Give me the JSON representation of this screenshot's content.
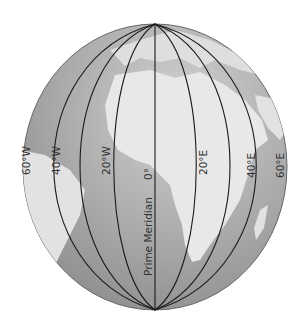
{
  "figure": {
    "type": "globe-meridians",
    "colors": {
      "ocean": "#9a9a9a",
      "ocean_light": "#c4c4c4",
      "land": "#e6e6e6",
      "lines": "#1a1a1a",
      "text": "#333333"
    },
    "meridians": [
      {
        "label": "60°W",
        "lon": -60
      },
      {
        "label": "40°W",
        "lon": -40
      },
      {
        "label": "20°W",
        "lon": -20
      },
      {
        "label": "0°",
        "lon": 0
      },
      {
        "label": "20°E",
        "lon": 20
      },
      {
        "label": "40°E",
        "lon": 40
      },
      {
        "label": "60°E",
        "lon": 60
      }
    ],
    "prime_meridian_label": "Prime Meridian",
    "zero_label": "0°"
  }
}
